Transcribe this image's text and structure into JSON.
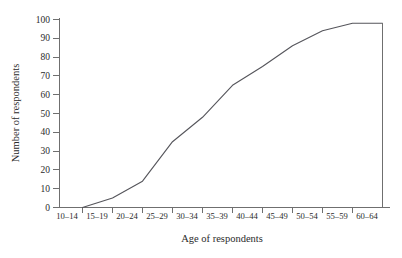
{
  "chart_data": {
    "type": "line",
    "title": "",
    "subtitle": "",
    "xlabel": "Age of respondents",
    "ylabel": "Number of respondents",
    "categories": [
      "10–14",
      "15–19",
      "20–24",
      "25–29",
      "30–34",
      "35–39",
      "40–44",
      "45–49",
      "50–54",
      "55–59",
      "60–64"
    ],
    "x_tick_labels": [
      "10–14",
      "15–19",
      "20–24",
      "25–29",
      "30–34",
      "35–39",
      "40–44",
      "45–49",
      "50–54",
      "55–59",
      "60–64"
    ],
    "y_tick_labels": [
      "0",
      "10",
      "20",
      "30",
      "40",
      "50",
      "60",
      "70",
      "80",
      "90",
      "100"
    ],
    "y_ticks": [
      0,
      10,
      20,
      30,
      40,
      50,
      60,
      70,
      80,
      90,
      100
    ],
    "ylim": [
      0,
      100
    ],
    "grid": false,
    "legend": false,
    "legend_position": "none",
    "series": [
      {
        "name": "Cumulative respondents",
        "x_positions": [
          1,
          2,
          3,
          4,
          5,
          6,
          7,
          8,
          9,
          10,
          11
        ],
        "values": [
          0,
          5,
          14,
          35,
          48,
          65,
          75,
          86,
          94,
          98,
          98
        ]
      }
    ],
    "annotations": [
      {
        "name": "right-closure-drop-line",
        "x": 11,
        "y_from": 98,
        "y_to": 0
      }
    ],
    "colors": {
      "curve": "#55555b",
      "axis": "#6f6f6f",
      "text": "#2b2b2b",
      "background": "#ffffff"
    }
  },
  "axis_titles": {
    "x": "Age of respondents",
    "y": "Number of respondents"
  }
}
